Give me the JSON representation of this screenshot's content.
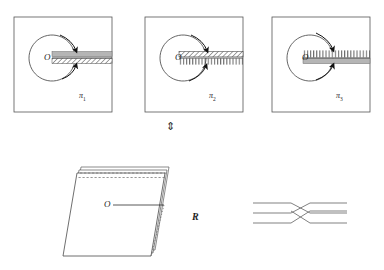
{
  "figure": {
    "type": "mathematical-diagram",
    "background_color": "#ffffff",
    "ink_color": "#1f1f1f",
    "shade_color": "#b8b8b8"
  },
  "panels": [
    {
      "id": "panel-1",
      "label": "π",
      "subscript": "1",
      "center_label": "O",
      "frame": {
        "x": 14,
        "y": 17,
        "w": 98,
        "h": 95
      },
      "circle": {
        "cx": 52,
        "cy": 58,
        "r": 23
      },
      "slit": {
        "x1": 52,
        "y1": 58,
        "x2": 112,
        "y2": 58
      },
      "strip_style": "gray-band-over-hatched-band",
      "arrow_count": 2
    },
    {
      "id": "panel-2",
      "label": "π",
      "subscript": "2",
      "center_label": "O",
      "frame": {
        "x": 145,
        "y": 17,
        "w": 98,
        "h": 95
      },
      "circle": {
        "cx": 183,
        "cy": 58,
        "r": 23
      },
      "slit": {
        "x1": 183,
        "y1": 58,
        "x2": 243,
        "y2": 58
      },
      "strip_style": "hatched-band-over-comb-teeth",
      "arrow_count": 2
    },
    {
      "id": "panel-3",
      "label": "π",
      "subscript": "3",
      "center_label": "O",
      "frame": {
        "x": 272,
        "y": 17,
        "w": 98,
        "h": 95
      },
      "circle": {
        "cx": 310,
        "cy": 58,
        "r": 23
      },
      "slit": {
        "x1": 310,
        "y1": 58,
        "x2": 370,
        "y2": 58
      },
      "strip_style": "comb-teeth-over-gray-band",
      "arrow_count": 2
    }
  ],
  "correspondence": {
    "symbol": "⇕",
    "name": "up-down-double-arrow",
    "x": 170,
    "y": 124
  },
  "surface": {
    "id": "stacked-sheets",
    "label": "R",
    "center_label": "O",
    "sheet_count": 3,
    "top_edge_style": "dashed",
    "right_edge_style": "serrated",
    "leader_line": {
      "x1": 113,
      "y1": 205,
      "x2": 164,
      "y2": 205
    }
  },
  "braid": {
    "id": "crossing-diagram",
    "strand_count": 3,
    "left_x": 253,
    "right_x": 347,
    "cross_x": 300,
    "strand_y": [
      203,
      213,
      223
    ],
    "description": "three horizontal strands crossing in the middle"
  }
}
